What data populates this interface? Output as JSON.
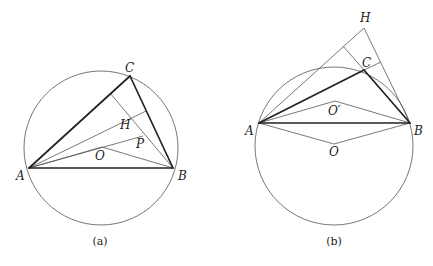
{
  "figure": {
    "width": 433,
    "height": 266,
    "colors": {
      "background": "#ffffff",
      "thin_line": "#555555",
      "thick_line": "#222222",
      "circle": "#666666",
      "text": "#222222"
    },
    "panels": [
      {
        "id": "a",
        "caption": "(a)",
        "caption_pos": [
          100,
          245
        ],
        "circle": {
          "cx": 101,
          "cy": 148,
          "r": 77
        },
        "points": {
          "A": [
            29,
            168
          ],
          "B": [
            173,
            168
          ],
          "C": [
            130,
            76
          ],
          "H": [
            132,
            118
          ],
          "O": [
            102,
            147
          ],
          "P": [
            143,
            136
          ],
          "footB_on_AC": [
            110,
            93
          ],
          "footA_on_BC": [
            146,
            111
          ]
        },
        "labels": [
          {
            "text": "A",
            "x": 16,
            "y": 180
          },
          {
            "text": "B",
            "x": 178,
            "y": 180
          },
          {
            "text": "C",
            "x": 125,
            "y": 72
          },
          {
            "text": "H",
            "x": 120,
            "y": 129
          },
          {
            "text": "P",
            "x": 136,
            "y": 148
          },
          {
            "text": "O",
            "x": 95,
            "y": 160
          }
        ],
        "thick_segments": [
          [
            "A",
            "B"
          ],
          [
            "A",
            "C"
          ],
          [
            "B",
            "C"
          ]
        ],
        "thin_segments": [
          [
            "A",
            "footA_on_BC"
          ],
          [
            "B",
            "footB_on_AC"
          ],
          [
            "A",
            "P"
          ],
          [
            "A",
            "O"
          ],
          [
            "O",
            "B"
          ]
        ]
      },
      {
        "id": "b",
        "caption": "(b)",
        "caption_pos": [
          334,
          245
        ],
        "circle": {
          "cx": 334,
          "cy": 146,
          "r": 79
        },
        "points": {
          "A": [
            259,
            123
          ],
          "B": [
            410,
            123
          ],
          "C": [
            364,
            70
          ],
          "H": [
            364,
            28
          ],
          "O": [
            334,
            144
          ],
          "Op": [
            335,
            101
          ],
          "footB_on_AH": [
            343,
            46
          ],
          "footA_on_BH": [
            381,
            62
          ]
        },
        "labels": [
          {
            "text": "A",
            "x": 245,
            "y": 135
          },
          {
            "text": "B",
            "x": 414,
            "y": 135
          },
          {
            "text": "C",
            "x": 362,
            "y": 67
          },
          {
            "text": "H",
            "x": 360,
            "y": 22
          },
          {
            "text": "O′",
            "x": 328,
            "y": 115
          },
          {
            "text": "O",
            "x": 329,
            "y": 156
          }
        ],
        "thick_segments": [
          [
            "A",
            "B"
          ],
          [
            "A",
            "C"
          ],
          [
            "B",
            "C"
          ]
        ],
        "thin_segments": [
          [
            "A",
            "H"
          ],
          [
            "B",
            "H"
          ],
          [
            "C",
            "footA_on_BH"
          ],
          [
            "C",
            "footB_on_AH"
          ],
          [
            "A",
            "Op"
          ],
          [
            "Op",
            "B"
          ],
          [
            "A",
            "O"
          ],
          [
            "O",
            "B"
          ]
        ]
      }
    ]
  }
}
